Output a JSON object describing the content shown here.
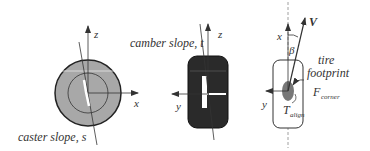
{
  "diagram": {
    "panels": [
      {
        "id": "side-view",
        "axes": {
          "vertical": "z",
          "horizontal": "x"
        },
        "caption": "caster slope, s"
      },
      {
        "id": "front-view",
        "axes": {
          "vertical": "z",
          "horizontal": "y"
        },
        "caption": "camber slope, t"
      },
      {
        "id": "top-view",
        "axes": {
          "vertical": "x",
          "horizontal": "y"
        },
        "velocity_label": "V",
        "angle_label": "β",
        "footprint_label_line1": "tire",
        "footprint_label_line2": "footprint",
        "force_label": "F",
        "force_subscript": "corner",
        "torque_label": "T",
        "torque_subscript": "align"
      }
    ],
    "colors": {
      "tire_fill_side": "#a8a8a8",
      "tire_fill_front": "#2a2a2a",
      "footprint_fill": "#777777",
      "line": "#333333"
    }
  }
}
